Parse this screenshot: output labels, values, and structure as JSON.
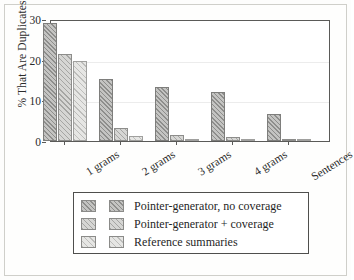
{
  "chart_data": {
    "type": "bar",
    "title": "",
    "subtitle": "",
    "xlabel": "",
    "ylabel": "% That Are Duplicates",
    "categories": [
      "1 grams",
      "2 grams",
      "3 grams",
      "4 grams",
      "Sentences"
    ],
    "series": [
      {
        "name": "Pointer-generator, no coverage",
        "values": [
          29.0,
          15.2,
          13.2,
          12.1,
          6.6
        ]
      },
      {
        "name": "Pointer-generator + coverage",
        "values": [
          21.3,
          3.2,
          1.4,
          0.9,
          0.1
        ]
      },
      {
        "name": "Reference summaries",
        "values": [
          19.6,
          1.3,
          0.15,
          0.05,
          0.03
        ]
      }
    ],
    "ylim": [
      0,
      30
    ],
    "yticks": [
      0,
      10,
      20,
      30
    ],
    "ytick_labels": [
      "0",
      "10",
      "20",
      "30"
    ],
    "grid": true,
    "grid_axis": "y",
    "legend_position": "below-axes",
    "legend_entries": [
      "Pointer-generator, no coverage",
      "Pointer-generator + coverage",
      "Reference summaries"
    ],
    "xtick_rotation": -32
  },
  "figure": {
    "ylabel": "% That Are Duplicates"
  }
}
